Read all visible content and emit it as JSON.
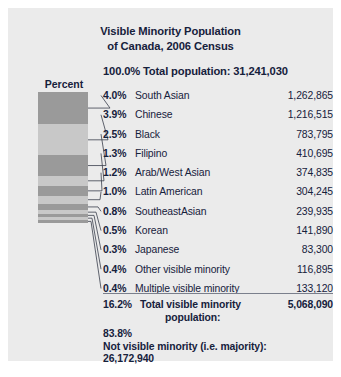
{
  "figure": {
    "title_line1": "Visible Minority Population",
    "title_line2": "of Canada, 2006 Census",
    "subtitle": "100.0% Total population: 31,241,030",
    "percent_header": "Percent",
    "panel_color": "#ebebeb",
    "text_color": "#16213c",
    "rule_color": "#7a7f8c",
    "segment_color_dark": "#9a9a9a",
    "segment_color_light": "#c8c8c8"
  },
  "total_row": {
    "percent": "16.2%",
    "label_line1": "Total visible minority",
    "label_line2": "population:",
    "value": "5,068,090"
  },
  "majority": {
    "percent": "83.8%",
    "label": "Not visible minority (i.e. majority):",
    "value": "26,172,940"
  },
  "chart_data": {
    "type": "bar",
    "title": "Visible Minority Population of Canada, 2006 Census",
    "xlabel": "",
    "ylabel": "Percent",
    "orientation": "stacked-vertical",
    "categories": [
      "South Asian",
      "Chinese",
      "Black",
      "Filipino",
      "Arab/West Asian",
      "Latin American",
      "SoutheastAsian",
      "Korean",
      "Japanese",
      "Other visible minority",
      "Multiple visible minority"
    ],
    "values": [
      4.0,
      3.9,
      2.5,
      1.3,
      1.2,
      1.0,
      0.8,
      0.5,
      0.3,
      0.4,
      0.4
    ],
    "counts": [
      1262865,
      1216515,
      783795,
      410695,
      374835,
      304245,
      239935,
      141890,
      83300,
      116895,
      133120
    ],
    "percent_labels": [
      "4.0%",
      "3.9%",
      "2.5%",
      "1.3%",
      "1.2%",
      "1.0%",
      "0.8%",
      "0.5%",
      "0.3%",
      "0.4%",
      "0.4%"
    ],
    "count_labels": [
      "1,262,865",
      "1,216,515",
      "783,795",
      "410,695",
      "374,835",
      "304,245",
      "239,935",
      "141,890",
      "83,300",
      "116,895",
      "133,120"
    ],
    "total_percent": 16.2,
    "total_count": 5068090,
    "population_total_percent": 100.0,
    "population_total": 31241030,
    "not_visible_minority_percent": 83.8,
    "not_visible_minority_count": 26172940,
    "grid": false,
    "legend": "none"
  },
  "rows": [
    {
      "pct": "4.0%",
      "cat": "South Asian",
      "num": "1,262,865"
    },
    {
      "pct": "3.9%",
      "cat": "Chinese",
      "num": "1,216,515"
    },
    {
      "pct": "2.5%",
      "cat": "Black",
      "num": "783,795"
    },
    {
      "pct": "1.3%",
      "cat": "Filipino",
      "num": "410,695"
    },
    {
      "pct": "1.2%",
      "cat": "Arab/West Asian",
      "num": "374,835"
    },
    {
      "pct": "1.0%",
      "cat": "Latin American",
      "num": "304,245"
    },
    {
      "pct": "0.8%",
      "cat": "SoutheastAsian",
      "num": "239,935"
    },
    {
      "pct": "0.5%",
      "cat": "Korean",
      "num": "141,890"
    },
    {
      "pct": "0.3%",
      "cat": "Japanese",
      "num": "83,300"
    },
    {
      "pct": "0.4%",
      "cat": "Other visible minority",
      "num": "116,895"
    },
    {
      "pct": "0.4%",
      "cat": "Multiple visible minority",
      "num": "133,120"
    }
  ]
}
